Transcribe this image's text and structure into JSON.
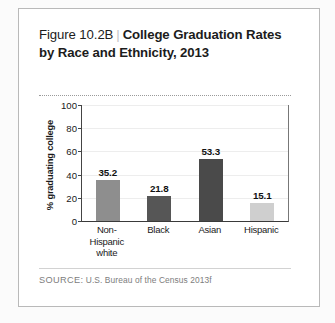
{
  "figure": {
    "number_label": "Figure 10.2B",
    "separator": "|",
    "title": "College Graduation Rates by Race and Ethnicity, 2013",
    "source_label": "SOURCE:",
    "source_text": "U.S. Bureau of the Census 2013f"
  },
  "chart_data": {
    "type": "bar",
    "title": "College Graduation Rates by Race and Ethnicity, 2013",
    "xlabel": "",
    "ylabel": "% graduating college",
    "ylim": [
      0,
      100
    ],
    "yticks": [
      0,
      20,
      40,
      60,
      80,
      100
    ],
    "grid": true,
    "legend": "none",
    "categories": [
      "Non-Hispanic white",
      "Black",
      "Asian",
      "Hispanic"
    ],
    "category_lines": [
      [
        "Non-Hispanic",
        "white"
      ],
      [
        "Black"
      ],
      [
        "Asian"
      ],
      [
        "Hispanic"
      ]
    ],
    "values": [
      35.2,
      21.8,
      53.3,
      15.1
    ],
    "value_labels": [
      "35.2",
      "21.8",
      "53.3",
      "15.1"
    ],
    "bar_colors": [
      "#8e8e8e",
      "#565656",
      "#4a4a4a",
      "#cfcfcf"
    ]
  },
  "axis": {
    "tick_labels": [
      "100",
      "80",
      "60",
      "40",
      "20",
      "0"
    ]
  },
  "colors": {
    "card_border": "#b9b9b9",
    "page_background": "#fbfbfb",
    "text": "#1c1c1c",
    "muted_text": "#7d7d7d",
    "gridline": "#ededed"
  }
}
